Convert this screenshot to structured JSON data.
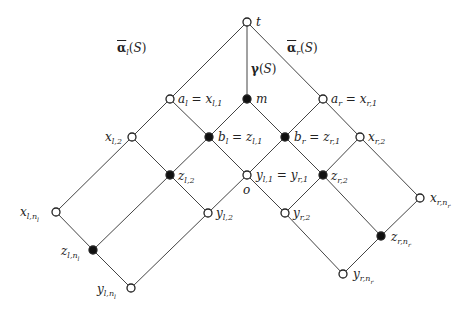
{
  "diagram": {
    "type": "lattice",
    "nodes": [
      {
        "id": "t",
        "x": 247,
        "y": 22,
        "filled": false,
        "label": "t",
        "lx": 256,
        "ly": 16
      },
      {
        "id": "a_l",
        "x": 170,
        "y": 99,
        "filled": false,
        "label": "a_l = x_{l,1}",
        "lx": 178,
        "ly": 93
      },
      {
        "id": "m",
        "x": 247,
        "y": 99,
        "filled": true,
        "label": "m",
        "lx": 256,
        "ly": 93
      },
      {
        "id": "a_r",
        "x": 323,
        "y": 99,
        "filled": false,
        "label": "a_r = x_{r,1}",
        "lx": 331,
        "ly": 93
      },
      {
        "id": "x_l2",
        "x": 132,
        "y": 137,
        "filled": false,
        "label": "x_{l,2}",
        "lx": 105,
        "ly": 131
      },
      {
        "id": "b_l",
        "x": 209,
        "y": 137,
        "filled": true,
        "label": "b_l = z_{l,1}",
        "lx": 218,
        "ly": 131
      },
      {
        "id": "b_r",
        "x": 285,
        "y": 137,
        "filled": true,
        "label": "b_r = z_{r,1}",
        "lx": 294,
        "ly": 131
      },
      {
        "id": "x_r2",
        "x": 360,
        "y": 137,
        "filled": false,
        "label": "x_{r,2}",
        "lx": 368,
        "ly": 131
      },
      {
        "id": "z_l2",
        "x": 170,
        "y": 175,
        "filled": true,
        "label": "z_{l,2}",
        "lx": 178,
        "ly": 170
      },
      {
        "id": "o",
        "x": 247,
        "y": 175,
        "filled": false,
        "label": "y_{l,1} = y_{r,1}",
        "lx": 256,
        "ly": 169
      },
      {
        "id": "z_r2",
        "x": 323,
        "y": 175,
        "filled": true,
        "label": "z_{r,2}",
        "lx": 331,
        "ly": 170
      },
      {
        "id": "x_ln",
        "x": 56,
        "y": 212,
        "filled": false,
        "label": "x_{l,n_l}",
        "lx": 20,
        "ly": 206
      },
      {
        "id": "y_l2",
        "x": 208,
        "y": 213,
        "filled": false,
        "label": "y_{l,2}",
        "lx": 216,
        "ly": 207
      },
      {
        "id": "y_r2",
        "x": 285,
        "y": 213,
        "filled": false,
        "label": "y_{r,2}",
        "lx": 293,
        "ly": 207
      },
      {
        "id": "x_rn",
        "x": 420,
        "y": 198,
        "filled": false,
        "label": "x_{r,n_r}",
        "lx": 430,
        "ly": 192
      },
      {
        "id": "z_ln",
        "x": 93,
        "y": 250,
        "filled": true,
        "label": "z_{l,n_l}",
        "lx": 61,
        "ly": 245
      },
      {
        "id": "z_rn",
        "x": 381,
        "y": 236,
        "filled": true,
        "label": "z_{r,n_r}",
        "lx": 391,
        "ly": 231
      },
      {
        "id": "y_ln",
        "x": 131,
        "y": 288,
        "filled": false,
        "label": "y_{l,n_l}",
        "lx": 97,
        "ly": 283
      },
      {
        "id": "y_rn",
        "x": 343,
        "y": 274,
        "filled": false,
        "label": "y_{r,n_r}",
        "lx": 353,
        "ly": 268
      }
    ],
    "edges": [
      [
        "t",
        "a_l"
      ],
      [
        "t",
        "m"
      ],
      [
        "t",
        "a_r"
      ],
      [
        "a_l",
        "x_l2"
      ],
      [
        "a_l",
        "b_l"
      ],
      [
        "m",
        "b_l"
      ],
      [
        "m",
        "b_r"
      ],
      [
        "a_r",
        "b_r"
      ],
      [
        "a_r",
        "x_r2"
      ],
      [
        "x_l2",
        "z_l2"
      ],
      [
        "b_l",
        "z_l2"
      ],
      [
        "b_l",
        "o"
      ],
      [
        "b_r",
        "o"
      ],
      [
        "b_r",
        "z_r2"
      ],
      [
        "x_r2",
        "z_r2"
      ],
      [
        "x_l2",
        "x_ln"
      ],
      [
        "z_l2",
        "z_ln"
      ],
      [
        "z_l2",
        "y_l2"
      ],
      [
        "o",
        "y_l2"
      ],
      [
        "o",
        "y_r2"
      ],
      [
        "z_r2",
        "y_r2"
      ],
      [
        "z_r2",
        "z_rn"
      ],
      [
        "x_r2",
        "x_rn"
      ],
      [
        "x_ln",
        "z_ln"
      ],
      [
        "z_ln",
        "y_ln"
      ],
      [
        "y_l2",
        "y_ln"
      ],
      [
        "y_r2",
        "y_rn"
      ],
      [
        "z_rn",
        "y_rn"
      ],
      [
        "x_rn",
        "z_rn"
      ]
    ],
    "edge_labels": {
      "alpha_l": {
        "base": "α",
        "sub": "l",
        "arg": "(S)",
        "x": 117,
        "y": 42
      },
      "gamma": {
        "base": "γ",
        "arg": "(S)",
        "x": 251,
        "y": 63
      },
      "alpha_r": {
        "base": "α",
        "sub": "r",
        "arg": "(S)",
        "x": 287,
        "y": 42
      }
    },
    "o_label": {
      "text": "o",
      "x": 243,
      "y": 184
    },
    "colors": {
      "line": "#444444",
      "node_stroke": "#222222",
      "filled": "#111111",
      "open": "#ffffff"
    }
  }
}
